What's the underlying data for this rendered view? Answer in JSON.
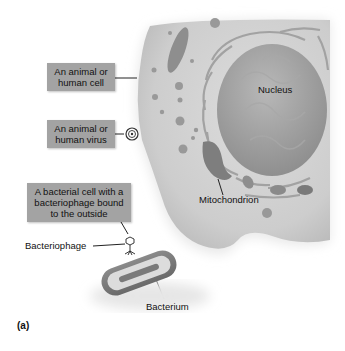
{
  "figure": {
    "panel_label": "(a)",
    "callouts": {
      "animal_cell": "An animal or human cell",
      "animal_virus": "An animal or human virus",
      "bacterial_cell": "A bacterial cell with a bacteriophage bound to the outside"
    },
    "labels": {
      "nucleus": "Nucleus",
      "mitochondrion": "Mitochondrion",
      "bacteriophage": "Bacteriophage",
      "bacterium": "Bacterium"
    },
    "colors": {
      "callout_box": "#a3a3a3",
      "cytoplasm": "#cfcfcf",
      "nucleus": "#9a9a9a",
      "organelle": "#8a8a8a"
    }
  }
}
